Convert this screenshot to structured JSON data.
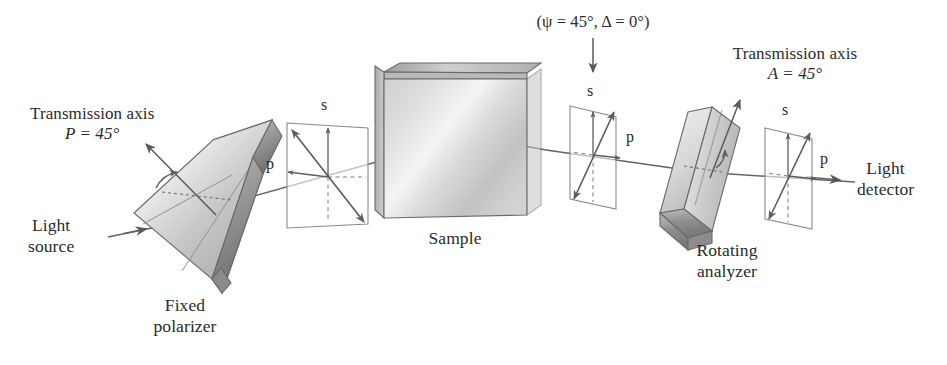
{
  "figure": {
    "background_color": "#ffffff",
    "ink_color": "#2b2b2b",
    "line_color": "#595959",
    "component_fill_light": "#e8e8e8",
    "component_fill_mid": "#c9c9c9",
    "component_fill_dark": "#9a9a9a"
  },
  "labels": {
    "light_source": {
      "line1": "Light",
      "line2": "source"
    },
    "transmission_axis_left": {
      "line1": "Transmission axis",
      "line2": "P = 45°",
      "symbol": "P",
      "value": "45°"
    },
    "fixed_polarizer": {
      "line1": "Fixed",
      "line2": "polarizer"
    },
    "sample": {
      "text": "Sample"
    },
    "sample_state": {
      "text": "(ψ = 45°, Δ = 0°)",
      "psi": "45°",
      "delta": "0°"
    },
    "transmission_axis_right": {
      "line1": "Transmission axis",
      "line2": "A = 45°",
      "symbol": "A",
      "value": "45°"
    },
    "rotating_analyzer": {
      "line1": "Rotating",
      "line2": "analyzer"
    },
    "light_detector": {
      "line1": "Light",
      "line2": "detector"
    }
  },
  "polarization_planes": [
    {
      "name": "after-polarizer",
      "s_axis_label": "s",
      "p_axis_label": "p",
      "state": "linear-135",
      "description": "Linear polarization, double-headed arrow along the 135 degree diagonal"
    },
    {
      "name": "after-sample",
      "s_axis_label": "s",
      "p_axis_label": "p",
      "state": "linear-45",
      "description": "Linear polarization at 45 degrees, psi = 45, delta = 0"
    },
    {
      "name": "after-analyzer",
      "s_axis_label": "s",
      "p_axis_label": "p",
      "state": "linear-45",
      "description": "Linear polarization at 45 degrees passing the analyzer transmission axis"
    }
  ],
  "components": [
    {
      "name": "fixed-polarizer",
      "shape": "tilted-slab"
    },
    {
      "name": "sample",
      "shape": "flat-plate"
    },
    {
      "name": "rotating-analyzer",
      "shape": "tilted-prism"
    }
  ],
  "beam": {
    "name": "light-beam",
    "description": "Beam travels left to right, reflects from the sample surface and arrives at the detector",
    "arrow_count": 5
  }
}
